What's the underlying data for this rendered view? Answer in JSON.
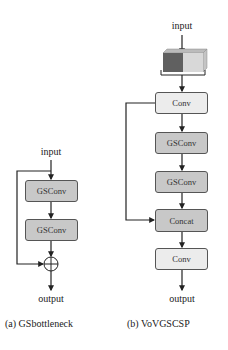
{
  "diagram_a": {
    "input_label": "input",
    "blocks": [
      {
        "label": "GSConv",
        "style": "dark"
      },
      {
        "label": "GSConv",
        "style": "dark"
      }
    ],
    "merge_symbol": "add",
    "output_label": "output",
    "caption": "(a)  GSbottleneck"
  },
  "diagram_b": {
    "input_label": "input",
    "split_block": {
      "type": "feature-map-tensor",
      "left_color": "#606060",
      "right_color": "#d8d8d8"
    },
    "blocks": [
      {
        "label": "Conv",
        "style": "light"
      },
      {
        "label": "GSConv",
        "style": "dark"
      },
      {
        "label": "GSConv",
        "style": "dark"
      },
      {
        "label": "Concat",
        "style": "dark"
      },
      {
        "label": "Conv",
        "style": "light"
      }
    ],
    "output_label": "output",
    "caption": "(b)  VoVGSCSP"
  },
  "colors": {
    "dark_block": "#c8c8c8",
    "light_block": "#ececec",
    "line": "#222222"
  }
}
